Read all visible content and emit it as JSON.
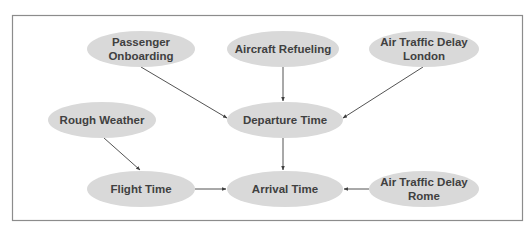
{
  "diagram": {
    "type": "directed-graph",
    "colors": {
      "node_fill": "#d9d9d9",
      "node_text": "#404040",
      "edge": "#404040",
      "frame_border": "#8c8c8c",
      "background": "#ffffff"
    },
    "nodes": [
      {
        "id": "passenger_onboarding",
        "lines": [
          "Passenger",
          "Onboarding"
        ],
        "cx": 141,
        "cy": 49,
        "rx": 54,
        "ry": 18
      },
      {
        "id": "aircraft_refueling",
        "lines": [
          "Aircraft Refueling"
        ],
        "cx": 283,
        "cy": 49,
        "rx": 56,
        "ry": 18
      },
      {
        "id": "atd_london",
        "lines": [
          "Air Traffic Delay",
          "London"
        ],
        "cx": 424,
        "cy": 49,
        "rx": 55,
        "ry": 18
      },
      {
        "id": "rough_weather",
        "lines": [
          "Rough Weather"
        ],
        "cx": 102,
        "cy": 120,
        "rx": 54,
        "ry": 18
      },
      {
        "id": "departure_time",
        "lines": [
          "Departure Time"
        ],
        "cx": 285,
        "cy": 120,
        "rx": 58,
        "ry": 18
      },
      {
        "id": "flight_time",
        "lines": [
          "Flight Time"
        ],
        "cx": 141,
        "cy": 189,
        "rx": 54,
        "ry": 18
      },
      {
        "id": "arrival_time",
        "lines": [
          "Arrival Time"
        ],
        "cx": 285,
        "cy": 189,
        "rx": 58,
        "ry": 18
      },
      {
        "id": "atd_rome",
        "lines": [
          "Air Traffic Delay",
          "Rome"
        ],
        "cx": 424,
        "cy": 189,
        "rx": 55,
        "ry": 18
      }
    ],
    "edges": [
      {
        "from": "passenger_onboarding",
        "to": "departure_time",
        "x1": 141,
        "y1": 67,
        "x2": 227,
        "y2": 118
      },
      {
        "from": "aircraft_refueling",
        "to": "departure_time",
        "x1": 283,
        "y1": 67,
        "x2": 283,
        "y2": 101
      },
      {
        "from": "atd_london",
        "to": "departure_time",
        "x1": 423,
        "y1": 67,
        "x2": 343,
        "y2": 118
      },
      {
        "from": "rough_weather",
        "to": "flight_time",
        "x1": 104,
        "y1": 138,
        "x2": 140,
        "y2": 170
      },
      {
        "from": "departure_time",
        "to": "arrival_time",
        "x1": 283,
        "y1": 138,
        "x2": 283,
        "y2": 170
      },
      {
        "from": "flight_time",
        "to": "arrival_time",
        "x1": 195,
        "y1": 189,
        "x2": 226,
        "y2": 189
      },
      {
        "from": "atd_rome",
        "to": "arrival_time",
        "x1": 369,
        "y1": 189,
        "x2": 344,
        "y2": 189
      }
    ]
  }
}
